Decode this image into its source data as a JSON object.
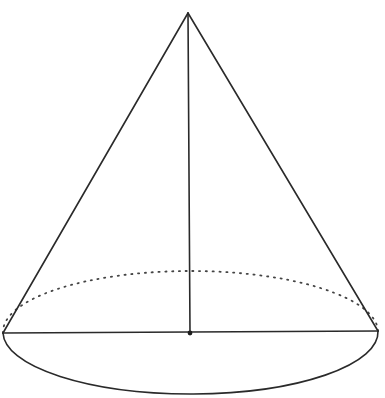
{
  "figure": {
    "type": "geometric-diagram",
    "labels": [],
    "colors": {
      "background": "#ffffff",
      "stroke": "#2a2a2a",
      "hidden_edge": "#444444"
    },
    "elements": {
      "apex": {
        "x": 188,
        "y": 13
      },
      "base_left": {
        "x": 3,
        "y": 333
      },
      "base_right": {
        "x": 378,
        "y": 331
      },
      "base_center": {
        "x": 190,
        "y": 333
      },
      "base_ellipse": {
        "cx": 190.5,
        "cy": 332,
        "rx": 187.5,
        "ry_front": 62,
        "ry_back": 60
      },
      "height_segment": {
        "from": "apex",
        "to": "base_center",
        "style": "solid"
      },
      "diameter_segment": {
        "from": "base_left",
        "to": "base_right",
        "style": "solid"
      },
      "back_base_arc": {
        "style": "dotted"
      },
      "front_base_arc": {
        "style": "solid"
      }
    }
  }
}
